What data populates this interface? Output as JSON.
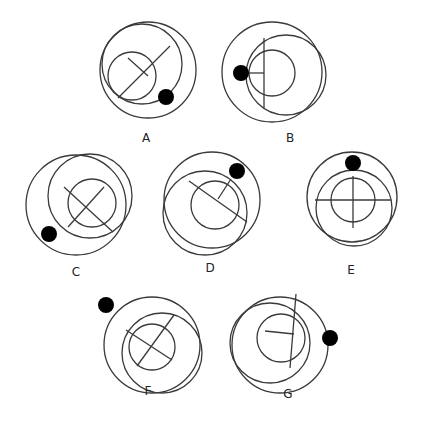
{
  "diagram": {
    "type": "odd-one-out puzzle",
    "figures": [
      {
        "label": "A",
        "outer": {
          "cx": 148,
          "cy": 70,
          "r": 48
        },
        "middle": {
          "cx": 142,
          "cy": 64,
          "r": 40
        },
        "inner": {
          "cx": 132,
          "cy": 76,
          "r": 24
        },
        "lines": [
          [
            118,
            98,
            170,
            46
          ],
          [
            128,
            58,
            148,
            76
          ]
        ],
        "dot": {
          "cx": 166,
          "cy": 97,
          "r": 8
        },
        "label_pos": [
          146,
          142
        ]
      },
      {
        "label": "B",
        "outer": {
          "cx": 272,
          "cy": 72,
          "r": 50
        },
        "middle": {
          "cx": 286,
          "cy": 75,
          "r": 40
        },
        "inner": {
          "cx": 272,
          "cy": 73,
          "r": 23
        },
        "lines": [
          [
            264,
            38,
            264,
            108
          ],
          [
            240,
            73,
            264,
            73
          ]
        ],
        "dot": {
          "cx": 241,
          "cy": 73,
          "r": 8
        },
        "label_pos": [
          290,
          142
        ]
      },
      {
        "label": "C",
        "outer": {
          "cx": 76,
          "cy": 205,
          "r": 50
        },
        "middle": {
          "cx": 90,
          "cy": 196,
          "r": 42
        },
        "inner": {
          "cx": 92,
          "cy": 203,
          "r": 24
        },
        "lines": [
          [
            64,
            187,
            113,
            232
          ],
          [
            68,
            227,
            104,
            187
          ]
        ],
        "dot": {
          "cx": 49,
          "cy": 234,
          "r": 8
        },
        "label_pos": [
          76,
          276
        ]
      },
      {
        "label": "D",
        "outer": {
          "cx": 212,
          "cy": 200,
          "r": 48
        },
        "middle": {
          "cx": 205,
          "cy": 213,
          "r": 42
        },
        "inner": {
          "cx": 215,
          "cy": 205,
          "r": 24
        },
        "lines": [
          [
            189,
            181,
            247,
            222
          ],
          [
            218,
            199,
            231,
            179
          ]
        ],
        "dot": {
          "cx": 237,
          "cy": 171,
          "r": 8
        },
        "label_pos": [
          210,
          272
        ]
      },
      {
        "label": "E",
        "outer": {
          "cx": 352,
          "cy": 197,
          "r": 45
        },
        "middle": {
          "cx": 354,
          "cy": 208,
          "r": 38
        },
        "inner": {
          "cx": 353,
          "cy": 200,
          "r": 22
        },
        "lines": [
          [
            315,
            200,
            391,
            200
          ],
          [
            353,
            176,
            353,
            228
          ]
        ],
        "dot": {
          "cx": 353,
          "cy": 163,
          "r": 8
        },
        "label_pos": [
          351,
          274
        ]
      },
      {
        "label": "F",
        "outer": {
          "cx": 152,
          "cy": 345,
          "r": 48
        },
        "middle": {
          "cx": 162,
          "cy": 353,
          "r": 40
        },
        "inner": {
          "cx": 152,
          "cy": 347,
          "r": 23
        },
        "lines": [
          [
            126,
            330,
            172,
            360
          ],
          [
            137,
            366,
            174,
            315
          ]
        ],
        "dot": {
          "cx": 106,
          "cy": 305,
          "r": 8
        },
        "label_pos": [
          148,
          395
        ]
      },
      {
        "label": "G",
        "outer": {
          "cx": 280,
          "cy": 345,
          "r": 48
        },
        "middle": {
          "cx": 270,
          "cy": 343,
          "r": 40
        },
        "inner": {
          "cx": 281,
          "cy": 338,
          "r": 24
        },
        "lines": [
          [
            265,
            331,
            294,
            334
          ],
          [
            296,
            294,
            290,
            368
          ]
        ],
        "dot": {
          "cx": 330,
          "cy": 338,
          "r": 8
        },
        "label_pos": [
          288,
          398
        ]
      }
    ]
  },
  "colors": {
    "stroke": "#3a3a3a",
    "dot": "#000000",
    "background": "#ffffff"
  }
}
